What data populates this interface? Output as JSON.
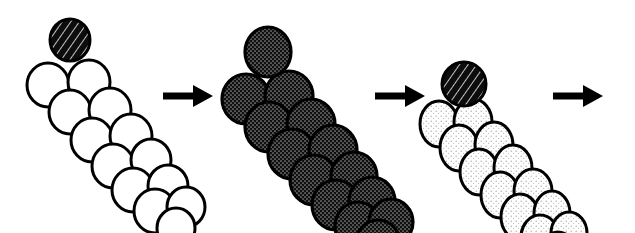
{
  "figure": {
    "background_color": "#ffffff",
    "width": 635,
    "height": 233
  },
  "palette": {
    "outline": "#000000",
    "white_fill": "#ffffff",
    "dark_fill": "#1a1a1a",
    "mid_stipple_fill": "#3b3b3b",
    "light_stipple_fill": "#f2f2f2",
    "arrow_color": "#000000"
  },
  "clusters": [
    {
      "id": "cluster-1",
      "label": "stage-1-unlabeled-filament",
      "cap": {
        "name": "cap-bead-dark-hatched",
        "fill_style": "dark-hatched",
        "cx": 70,
        "cy": 40,
        "rx": 20,
        "ry": 21
      },
      "body_fill_style": "white",
      "bead_count": 13,
      "beads": [
        {
          "cx": 48,
          "cy": 85,
          "rx": 21,
          "ry": 22
        },
        {
          "cx": 89,
          "cy": 82,
          "rx": 21,
          "ry": 22
        },
        {
          "cx": 70,
          "cy": 112,
          "rx": 21,
          "ry": 22
        },
        {
          "cx": 110,
          "cy": 110,
          "rx": 21,
          "ry": 22
        },
        {
          "cx": 92,
          "cy": 140,
          "rx": 21,
          "ry": 22
        },
        {
          "cx": 131,
          "cy": 136,
          "rx": 21,
          "ry": 22
        },
        {
          "cx": 113,
          "cy": 166,
          "rx": 21,
          "ry": 22
        },
        {
          "cx": 151,
          "cy": 160,
          "rx": 20,
          "ry": 21
        },
        {
          "cx": 133,
          "cy": 190,
          "rx": 21,
          "ry": 22
        },
        {
          "cx": 168,
          "cy": 186,
          "rx": 20,
          "ry": 21
        },
        {
          "cx": 155,
          "cy": 211,
          "rx": 21,
          "ry": 22
        },
        {
          "cx": 186,
          "cy": 207,
          "rx": 19,
          "ry": 20
        },
        {
          "cx": 176,
          "cy": 228,
          "rx": 19,
          "ry": 20
        }
      ]
    },
    {
      "id": "cluster-2",
      "label": "stage-2-fully-decorated-filament",
      "cap": {
        "name": "cap-bead-dark-stippled",
        "fill_style": "mid-stipple",
        "cx": 268,
        "cy": 52,
        "rx": 23,
        "ry": 25
      },
      "body_fill_style": "mid-stipple",
      "bead_count": 13,
      "beads": [
        {
          "cx": 246,
          "cy": 99,
          "rx": 24,
          "ry": 25
        },
        {
          "cx": 289,
          "cy": 96,
          "rx": 24,
          "ry": 25
        },
        {
          "cx": 269,
          "cy": 127,
          "rx": 24,
          "ry": 25
        },
        {
          "cx": 311,
          "cy": 124,
          "rx": 24,
          "ry": 25
        },
        {
          "cx": 292,
          "cy": 154,
          "rx": 24,
          "ry": 25
        },
        {
          "cx": 333,
          "cy": 150,
          "rx": 24,
          "ry": 25
        },
        {
          "cx": 314,
          "cy": 180,
          "rx": 24,
          "ry": 25
        },
        {
          "cx": 354,
          "cy": 176,
          "rx": 23,
          "ry": 24
        },
        {
          "cx": 336,
          "cy": 205,
          "rx": 24,
          "ry": 25
        },
        {
          "cx": 372,
          "cy": 201,
          "rx": 23,
          "ry": 24
        },
        {
          "cx": 358,
          "cy": 226,
          "rx": 23,
          "ry": 24
        },
        {
          "cx": 391,
          "cy": 222,
          "rx": 22,
          "ry": 23
        },
        {
          "cx": 378,
          "cy": 243,
          "rx": 22,
          "ry": 23
        }
      ]
    },
    {
      "id": "cluster-3",
      "label": "stage-3-lightly-decorated-filament",
      "cap": {
        "name": "cap-bead-dark-hatched",
        "fill_style": "dark-hatched",
        "cx": 464,
        "cy": 84,
        "rx": 22,
        "ry": 22
      },
      "body_fill_style": "light-stipple",
      "bead_count": 13,
      "beads": [
        {
          "cx": 439,
          "cy": 124,
          "rx": 19,
          "ry": 23
        },
        {
          "cx": 473,
          "cy": 122,
          "rx": 19,
          "ry": 23
        },
        {
          "cx": 459,
          "cy": 148,
          "rx": 19,
          "ry": 23
        },
        {
          "cx": 494,
          "cy": 145,
          "rx": 19,
          "ry": 23
        },
        {
          "cx": 479,
          "cy": 172,
          "rx": 19,
          "ry": 23
        },
        {
          "cx": 513,
          "cy": 168,
          "rx": 19,
          "ry": 23
        },
        {
          "cx": 500,
          "cy": 195,
          "rx": 19,
          "ry": 23
        },
        {
          "cx": 533,
          "cy": 191,
          "rx": 19,
          "ry": 22
        },
        {
          "cx": 520,
          "cy": 217,
          "rx": 19,
          "ry": 23
        },
        {
          "cx": 552,
          "cy": 213,
          "rx": 18,
          "ry": 22
        },
        {
          "cx": 540,
          "cy": 237,
          "rx": 19,
          "ry": 22
        },
        {
          "cx": 569,
          "cy": 233,
          "rx": 18,
          "ry": 21
        },
        {
          "cx": 558,
          "cy": 253,
          "rx": 18,
          "ry": 21
        }
      ]
    }
  ],
  "arrows": [
    {
      "id": "arrow-1",
      "label": "transition-arrow-1",
      "x": 163,
      "y": 96,
      "length": 50,
      "shaft_thickness": 7,
      "head_length": 20,
      "head_width": 22,
      "direction": "right"
    },
    {
      "id": "arrow-2",
      "label": "transition-arrow-2",
      "x": 375,
      "y": 96,
      "length": 50,
      "shaft_thickness": 7,
      "head_length": 20,
      "head_width": 22,
      "direction": "right"
    },
    {
      "id": "arrow-3",
      "label": "transition-arrow-3",
      "x": 553,
      "y": 96,
      "length": 50,
      "shaft_thickness": 7,
      "head_length": 20,
      "head_width": 22,
      "direction": "right"
    }
  ]
}
